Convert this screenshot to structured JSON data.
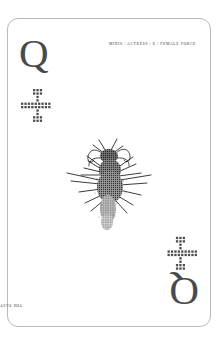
{
  "card": {
    "rank_top": "Q",
    "rank_bottom": "Q",
    "pip_top_name": "dotted-cross-pip",
    "pip_bottom_name": "dotted-cross-pip",
    "caption_top": "MIXIS / ACTRESS / E / FEMALE FORCE",
    "caption_bottom": "THE PAST SET / THE NEW PLACE",
    "illustration_name": "halftone-insect",
    "colors": {
      "card_background": "#ffffff",
      "card_border": "#b9b9b9",
      "rank_ink": "#4a4a4a",
      "caption_ink": "#3c3c3c",
      "pip_ink": "#4d4d4d",
      "illustration_ink": "#1a1a1a",
      "page_background": "#ffffff"
    }
  }
}
